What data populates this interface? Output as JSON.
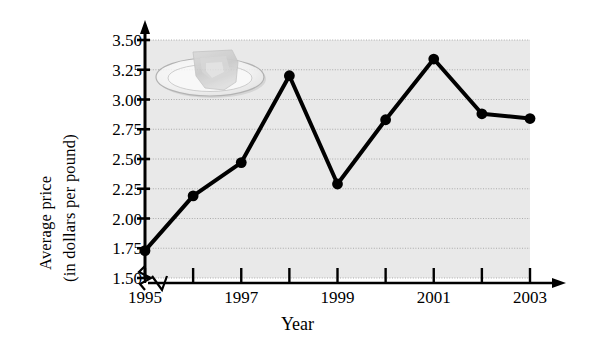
{
  "chart_data": {
    "type": "line",
    "title": "",
    "xlabel": "Year",
    "ylabel": "Average price (in dollars per pound)",
    "ylabel_lines": [
      "Average price",
      "(in dollars per pound)"
    ],
    "x": [
      1995,
      1996,
      1997,
      1998,
      1999,
      2000,
      2001,
      2002,
      2003
    ],
    "values": [
      1.73,
      2.19,
      2.47,
      3.2,
      2.29,
      2.83,
      3.34,
      2.88,
      2.84
    ],
    "categories": [
      "1995",
      "1996",
      "1997",
      "1998",
      "1999",
      "2000",
      "2001",
      "2002",
      "2003"
    ],
    "xlim": [
      1995,
      2003
    ],
    "ylim": [
      1.5,
      3.5
    ],
    "y_ticks": [
      1.5,
      1.75,
      2.0,
      2.25,
      2.5,
      2.75,
      3.0,
      3.25,
      3.5
    ],
    "y_tick_labels": [
      "1.50",
      "1.75",
      "2.00",
      "2.25",
      "2.50",
      "2.75",
      "3.00",
      "3.25",
      "3.50"
    ],
    "x_ticks": [
      1995,
      1996,
      1997,
      1998,
      1999,
      2000,
      2001,
      2002,
      2003
    ],
    "x_tick_labels": [
      "1995",
      "",
      "1997",
      "",
      "1999",
      "",
      "2001",
      "",
      "2003"
    ],
    "x_visible_tick_labels": [
      "1995",
      "1997",
      "1999",
      "2001",
      "2003"
    ],
    "grid": true,
    "grid_orientation": "horizontal",
    "legend": "none",
    "axis_break_x": true,
    "axis_break_y": true,
    "marker": "filled-circle",
    "line_color": "#000000",
    "marker_color": "#000000",
    "plot_background": "#e8e8e8",
    "grid_color": "#9a9a9a",
    "axis_color": "#000000",
    "decoration": "plate-of-food-image"
  },
  "axes": {
    "y_title_line1": "Average price",
    "y_title_line2": "(in dollars per pound)",
    "x_title": "Year"
  }
}
